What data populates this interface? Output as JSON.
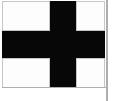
{
  "image": {
    "kind": "flag-illustration",
    "subject": "black cross flag",
    "width": 124,
    "height": 101,
    "background_color": "#ffffff"
  },
  "flag": {
    "field_color": "#ffffff",
    "cross_color": "#070707",
    "outline_color": "#b9b9b9",
    "quadrant_outline_color": "#c6c6c6",
    "description": "centered black cross on white field",
    "geometry": {
      "left": 2,
      "top": 1,
      "width": 103,
      "height": 87,
      "cross_vertical_left": 50,
      "cross_vertical_width": 26,
      "cross_horizontal_top": 31,
      "cross_horizontal_height": 27
    }
  },
  "quadrants": [
    {
      "name": "top-left",
      "color": "#fdfdfd"
    },
    {
      "name": "top-right",
      "color": "#fdfdfd"
    },
    {
      "name": "bottom-left",
      "color": "#fdfdfd"
    },
    {
      "name": "bottom-right",
      "color": "#fdfdfd"
    }
  ],
  "flagpole": {
    "color": "#aeaeae",
    "left": 106,
    "width": 2
  }
}
